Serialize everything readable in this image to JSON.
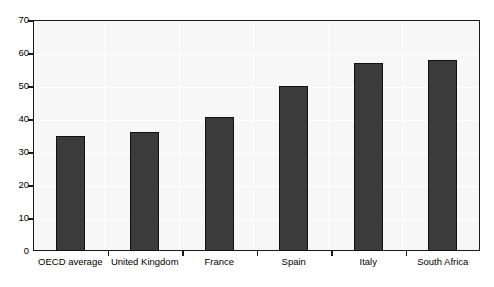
{
  "chart_data": {
    "type": "bar",
    "title": "",
    "subtitle": "",
    "xlabel": "",
    "ylabel": "",
    "categories": [
      "OECD average",
      "United Kingdom",
      "France",
      "Spain",
      "Italy",
      "South Africa"
    ],
    "values": [
      35,
      36,
      40.5,
      50,
      57,
      58
    ],
    "series": [
      {
        "name": "",
        "values": [
          35,
          36,
          40.5,
          50,
          57,
          58
        ]
      }
    ],
    "ylim": [
      0,
      70
    ],
    "ytick_labels": [
      "0",
      "10",
      "20",
      "30",
      "40",
      "50",
      "60",
      "70"
    ],
    "ytick_values": [
      0,
      10,
      20,
      30,
      40,
      50,
      60,
      70
    ],
    "grid": true,
    "legend": "none",
    "bar_color": "#3b3b3b",
    "bar_border_color": "#111111",
    "plot_background": "#f7f7f7",
    "axis_color": "#1a1a1a",
    "page_background": "#ffffff"
  }
}
